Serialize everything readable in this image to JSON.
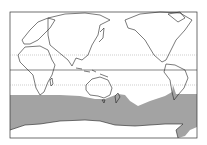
{
  "map": {
    "projection": "pacific-centered-world",
    "frame": {
      "x": 10,
      "y": 12,
      "width": 187,
      "height": 126
    },
    "lines": {
      "tropic_north_y": 55,
      "equator_y": 70,
      "tropic_south_y": 85
    },
    "range": {
      "label": "distribution-range",
      "color": "#a0a0a0",
      "region": "Southern Ocean circumpolar band"
    },
    "colors": {
      "land_outline": "#222222",
      "background": "#ffffff",
      "grid_dotted": "#999999"
    }
  }
}
